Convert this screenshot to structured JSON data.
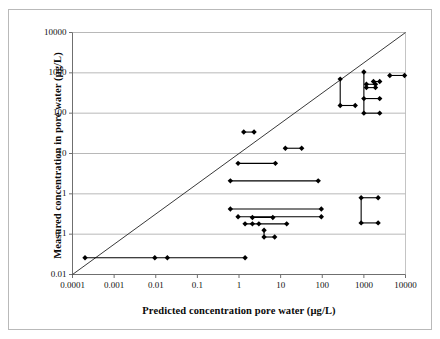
{
  "chart_data": {
    "type": "scatter",
    "title": "",
    "subtitle": "",
    "xlabel": "Predicted concentration pore water (µg/L)",
    "ylabel": "Measured concentration in  pore water (µg/L)",
    "xscale": "log",
    "yscale": "log",
    "xlim": [
      0.0001,
      10000
    ],
    "ylim": [
      0.01,
      10000
    ],
    "xticks": [
      "0.0001",
      "0.001",
      "0.01",
      "0.1",
      "1",
      "10",
      "100",
      "1000",
      "10000"
    ],
    "yticks": [
      "0.01",
      "0.1",
      "1",
      "10",
      "100",
      "1000",
      "10000"
    ],
    "xtick_values": [
      0.0001,
      0.001,
      0.01,
      0.1,
      1,
      10,
      100,
      1000,
      10000
    ],
    "ytick_values": [
      0.01,
      0.1,
      1,
      10,
      100,
      1000,
      10000
    ],
    "grid": "horizontal",
    "grid_color": "#b0b0b0",
    "legend": "none",
    "marker": "diamond",
    "marker_color": "#000000",
    "marker_size_px": 4,
    "series_color": "#000000",
    "annotations": [
      {
        "name": "one-to-one-line",
        "type": "line",
        "from": [
          0.0001,
          0.0001
        ],
        "to": [
          10000,
          10000
        ],
        "description": "1:1 diagonal reference line"
      }
    ],
    "connector_note": "Horizontal and vertical black segments connect paired predicted/measured values for the same compound",
    "segments": [
      {
        "name": "seg-bottom-row-a",
        "orientation": "horizontal",
        "y": 0.026,
        "x_from": 0.0002,
        "x_to": 1.4
      },
      {
        "name": "seg-35-pair",
        "orientation": "horizontal",
        "y": 34,
        "x_from": 1.3,
        "x_to": 2.3
      },
      {
        "name": "seg-13-pair",
        "orientation": "horizontal",
        "y": 13.5,
        "x_from": 13,
        "x_to": 32
      },
      {
        "name": "seg-5p7-pair",
        "orientation": "horizontal",
        "y": 5.7,
        "x_from": 0.95,
        "x_to": 7.5
      },
      {
        "name": "seg-2p1-pair",
        "orientation": "horizontal",
        "y": 2.1,
        "x_from": 0.62,
        "x_to": 80
      },
      {
        "name": "seg-0p42-pair",
        "orientation": "horizontal",
        "y": 0.42,
        "x_from": 0.62,
        "x_to": 95
      },
      {
        "name": "seg-0p27-pair",
        "orientation": "horizontal",
        "y": 0.27,
        "x_from": 0.95,
        "x_to": 95
      },
      {
        "name": "seg-0p26-short",
        "orientation": "horizontal",
        "y": 0.26,
        "x_from": 2.1,
        "x_to": 6.5
      },
      {
        "name": "seg-0p18-pair",
        "orientation": "horizontal",
        "y": 0.18,
        "x_from": 1.4,
        "x_to": 14
      },
      {
        "name": "seg-0p085-pair",
        "orientation": "horizontal",
        "y": 0.085,
        "x_from": 4.0,
        "x_to": 7.2
      },
      {
        "name": "seg-0p085-vert",
        "orientation": "vertical",
        "x": 4.0,
        "y_from": 0.085,
        "y_to": 0.125
      },
      {
        "name": "seg-right-0p8-0p19-vert",
        "orientation": "vertical",
        "x": 860,
        "y_from": 0.19,
        "y_to": 0.8
      },
      {
        "name": "seg-right-0p8-pair",
        "orientation": "horizontal",
        "y": 0.8,
        "x_from": 860,
        "x_to": 2200
      },
      {
        "name": "seg-right-0p19-pair",
        "orientation": "horizontal",
        "y": 0.19,
        "x_from": 860,
        "x_to": 2200
      },
      {
        "name": "seg-700-150-vert",
        "orientation": "vertical",
        "x": 270,
        "y_from": 155,
        "y_to": 700
      },
      {
        "name": "seg-150-pair",
        "orientation": "horizontal",
        "y": 155,
        "x_from": 270,
        "x_to": 620
      },
      {
        "name": "seg-1050-230-vert",
        "orientation": "vertical",
        "x": 1000,
        "y_from": 100,
        "y_to": 1050
      },
      {
        "name": "seg-230-pair",
        "orientation": "horizontal",
        "y": 230,
        "x_from": 1000,
        "x_to": 2400
      },
      {
        "name": "seg-100-pair",
        "orientation": "horizontal",
        "y": 100,
        "x_from": 1000,
        "x_to": 2400
      },
      {
        "name": "seg-500-pair",
        "orientation": "horizontal",
        "y": 520,
        "x_from": 1150,
        "x_to": 1900
      },
      {
        "name": "seg-430-pair",
        "orientation": "horizontal",
        "y": 430,
        "x_from": 1150,
        "x_to": 1900
      },
      {
        "name": "seg-500-430-vert",
        "orientation": "vertical",
        "x": 1150,
        "y_from": 430,
        "y_to": 520
      },
      {
        "name": "seg-600-pair",
        "orientation": "horizontal",
        "y": 610,
        "x_from": 1700,
        "x_to": 2400
      },
      {
        "name": "seg-850-pair",
        "orientation": "horizontal",
        "y": 860,
        "x_from": 4200,
        "x_to": 9500
      }
    ],
    "points": [
      {
        "x": 0.0002,
        "y": 0.026
      },
      {
        "x": 0.0095,
        "y": 0.026
      },
      {
        "x": 0.019,
        "y": 0.026
      },
      {
        "x": 1.4,
        "y": 0.026
      },
      {
        "x": 1.3,
        "y": 34
      },
      {
        "x": 2.3,
        "y": 34
      },
      {
        "x": 13,
        "y": 13.5
      },
      {
        "x": 32,
        "y": 13.5
      },
      {
        "x": 0.95,
        "y": 5.7
      },
      {
        "x": 7.5,
        "y": 5.7
      },
      {
        "x": 0.62,
        "y": 2.1
      },
      {
        "x": 80,
        "y": 2.1
      },
      {
        "x": 0.62,
        "y": 0.42
      },
      {
        "x": 95,
        "y": 0.42
      },
      {
        "x": 0.95,
        "y": 0.27
      },
      {
        "x": 95,
        "y": 0.27
      },
      {
        "x": 2.1,
        "y": 0.26
      },
      {
        "x": 6.5,
        "y": 0.26
      },
      {
        "x": 1.4,
        "y": 0.18
      },
      {
        "x": 2.1,
        "y": 0.18
      },
      {
        "x": 3.0,
        "y": 0.18
      },
      {
        "x": 14,
        "y": 0.18
      },
      {
        "x": 4.0,
        "y": 0.125
      },
      {
        "x": 4.0,
        "y": 0.085
      },
      {
        "x": 7.2,
        "y": 0.085
      },
      {
        "x": 860,
        "y": 0.8
      },
      {
        "x": 2200,
        "y": 0.8
      },
      {
        "x": 860,
        "y": 0.19
      },
      {
        "x": 2200,
        "y": 0.19
      },
      {
        "x": 270,
        "y": 700
      },
      {
        "x": 270,
        "y": 155
      },
      {
        "x": 620,
        "y": 155
      },
      {
        "x": 1000,
        "y": 1050
      },
      {
        "x": 1000,
        "y": 230
      },
      {
        "x": 2400,
        "y": 230
      },
      {
        "x": 1000,
        "y": 100
      },
      {
        "x": 2400,
        "y": 100
      },
      {
        "x": 1150,
        "y": 520
      },
      {
        "x": 1900,
        "y": 520
      },
      {
        "x": 1150,
        "y": 430
      },
      {
        "x": 1900,
        "y": 430
      },
      {
        "x": 1700,
        "y": 610
      },
      {
        "x": 2400,
        "y": 610
      },
      {
        "x": 4200,
        "y": 860
      },
      {
        "x": 9500,
        "y": 860
      }
    ]
  }
}
